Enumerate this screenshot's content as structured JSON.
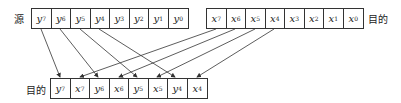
{
  "labels": {
    "source": "源",
    "dest_top": "目的",
    "dest_bottom": "目的"
  },
  "source_cells": [
    {
      "v": "y",
      "s": "7"
    },
    {
      "v": "y",
      "s": "6"
    },
    {
      "v": "y",
      "s": "5"
    },
    {
      "v": "y",
      "s": "4"
    },
    {
      "v": "y",
      "s": "3"
    },
    {
      "v": "y",
      "s": "2"
    },
    {
      "v": "y",
      "s": "1"
    },
    {
      "v": "y",
      "s": "0"
    }
  ],
  "dest_top_cells": [
    {
      "v": "x",
      "s": "7"
    },
    {
      "v": "x",
      "s": "6"
    },
    {
      "v": "x",
      "s": "5"
    },
    {
      "v": "x",
      "s": "4"
    },
    {
      "v": "x",
      "s": "3"
    },
    {
      "v": "x",
      "s": "2"
    },
    {
      "v": "x",
      "s": "1"
    },
    {
      "v": "x",
      "s": "0"
    }
  ],
  "result_cells": [
    {
      "v": "y",
      "s": "7"
    },
    {
      "v": "x",
      "s": "7"
    },
    {
      "v": "y",
      "s": "6"
    },
    {
      "v": "x",
      "s": "6"
    },
    {
      "v": "y",
      "s": "5"
    },
    {
      "v": "x",
      "s": "5"
    },
    {
      "v": "y",
      "s": "4"
    },
    {
      "v": "x",
      "s": "4"
    }
  ]
}
